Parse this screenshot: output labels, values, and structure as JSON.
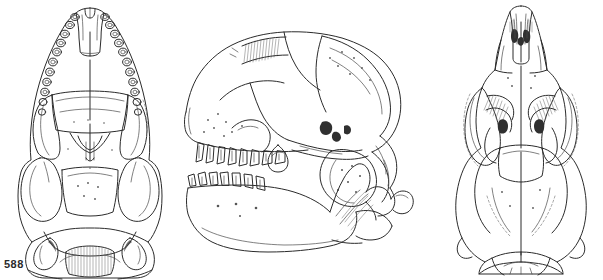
{
  "plate": {
    "plate_number": "588",
    "artist_monogram": "+ŋ",
    "background_color": "#ffffff",
    "ink_color": "#2b2b2b",
    "width": 603,
    "height": 280
  },
  "figures": [
    {
      "id": "ventral-skull",
      "name": "ventral-skull-view",
      "caption": "",
      "orientation": "ventral (palatal) view of skull",
      "x": 0,
      "y": 0,
      "width": 180,
      "height": 280,
      "features": [
        "incisors",
        "upper tooth row",
        "palate",
        "zygomatic arches",
        "auditory bullae",
        "basioccipital",
        "foramen magnum",
        "occipital condyles"
      ],
      "tooth_count_per_side": 11
    },
    {
      "id": "lateral-skull",
      "name": "lateral-skull-view",
      "caption": "",
      "orientation": "lateral (side) view of skull",
      "x": 180,
      "y": 20,
      "width": 250,
      "height": 140,
      "features": [
        "rostrum",
        "nasal",
        "orbit",
        "zygomatic arch",
        "braincase",
        "sagittal crest",
        "occipital region",
        "upper tooth row",
        "canine"
      ]
    },
    {
      "id": "mandible",
      "name": "mandible-lateral-view",
      "caption": "",
      "orientation": "lateral view of lower jaw",
      "x": 180,
      "y": 145,
      "width": 180,
      "height": 95,
      "features": [
        "lower tooth row",
        "coronoid process",
        "condyloid process",
        "angular process",
        "mandibular body",
        "mental foramina"
      ]
    },
    {
      "id": "dorsal-skull",
      "name": "dorsal-skull-view",
      "caption": "",
      "orientation": "dorsal (top) view of skull",
      "x": 440,
      "y": 0,
      "width": 163,
      "height": 280,
      "features": [
        "premaxillae",
        "nasals",
        "frontal",
        "postorbital constriction",
        "zygomatic arches",
        "parietals",
        "interparietal",
        "supraoccipital",
        "lambdoidal crest"
      ]
    }
  ]
}
